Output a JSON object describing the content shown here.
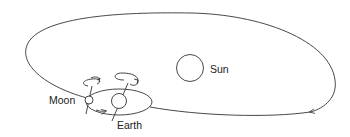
{
  "diagram": {
    "labels": {
      "sun": "Sun",
      "moon": "Moon",
      "earth": "Earth"
    },
    "elements": {
      "sun_orbit": "Earth's orbit around the Sun",
      "moon_orbit": "Moon's orbit around the Earth",
      "earth_spin": "Earth rotation arrow",
      "moon_spin": "Moon rotation arrow"
    },
    "colors": {
      "stroke": "#333333",
      "text": "#222222",
      "background": "#ffffff"
    }
  }
}
